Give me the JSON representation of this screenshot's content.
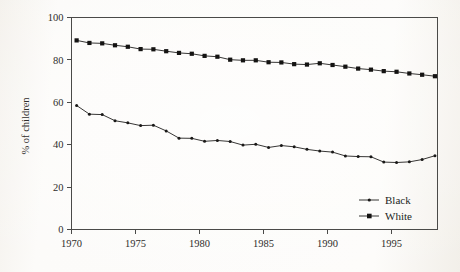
{
  "figure": {
    "background_color": "#fbfaf8",
    "ink_color": "#2e2c2a"
  },
  "chart_data": {
    "type": "line",
    "title": "",
    "xlabel": "",
    "ylabel": "% of children",
    "xlim": [
      1970,
      1998.6
    ],
    "ylim": [
      0,
      100
    ],
    "xticks": [
      1970,
      1975,
      1980,
      1985,
      1990,
      1995
    ],
    "xtick_labels": [
      "1970",
      "1975",
      "1980",
      "1985",
      "1990",
      "1995"
    ],
    "yticks": [
      0,
      20,
      40,
      60,
      80,
      100
    ],
    "ytick_labels": [
      "0",
      "20",
      "40",
      "60",
      "80",
      "100"
    ],
    "grid": false,
    "legend_position": "bottom-right",
    "x": [
      1970.4,
      1971.4,
      1972.4,
      1973.4,
      1974.4,
      1975.4,
      1976.4,
      1977.4,
      1978.4,
      1979.4,
      1980.4,
      1981.4,
      1982.4,
      1983.4,
      1984.4,
      1985.4,
      1986.4,
      1987.4,
      1988.4,
      1989.4,
      1990.4,
      1991.4,
      1992.4,
      1993.4,
      1994.4,
      1995.4,
      1996.4,
      1997.4,
      1998.4
    ],
    "series": [
      {
        "name": "Black",
        "marker": "small-dot",
        "color": "#1a1918",
        "values": [
          58.5,
          54.4,
          54.2,
          51.3,
          50.3,
          49.0,
          49.2,
          46.5,
          43.1,
          43.0,
          41.6,
          42.0,
          41.5,
          39.8,
          40.2,
          38.7,
          39.6,
          39.0,
          37.8,
          37.0,
          36.5,
          34.7,
          34.4,
          34.3,
          31.8,
          31.6,
          31.9,
          33.0,
          34.8
        ]
      },
      {
        "name": "White",
        "marker": "square",
        "color": "#141312",
        "values": [
          89.2,
          88.0,
          87.8,
          86.9,
          86.2,
          85.1,
          85.0,
          84.1,
          83.3,
          82.9,
          81.9,
          81.5,
          80.1,
          79.8,
          79.8,
          78.9,
          78.8,
          78.0,
          77.8,
          78.4,
          77.6,
          76.8,
          75.9,
          75.4,
          74.7,
          74.4,
          73.6,
          73.0,
          72.3
        ]
      }
    ]
  },
  "legend": {
    "entries": [
      {
        "label": "Black",
        "marker": "small-dot"
      },
      {
        "label": "White",
        "marker": "square"
      }
    ]
  }
}
